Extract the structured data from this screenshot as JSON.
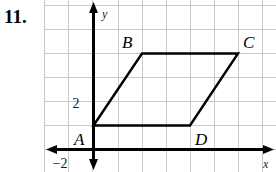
{
  "problem": {
    "number": "11."
  },
  "graph": {
    "axis_labels": {
      "x": "x",
      "y": "y"
    },
    "tick_labels": [
      {
        "text": "2",
        "axis": "y",
        "value": 2
      },
      {
        "text": "−2",
        "axis": "x",
        "value": -2
      }
    ],
    "grid": {
      "visible": true,
      "color": "#c8c8c8",
      "spacing_px": 24,
      "x_range": [
        -2,
        7
      ],
      "y_range": [
        -1,
        6
      ]
    },
    "axis_color": "#000000",
    "shape_color": "#000000",
    "shape": {
      "name": "parallelogram-abcd",
      "vertices": [
        {
          "label": "A",
          "x": 0,
          "y": 1
        },
        {
          "label": "B",
          "x": 2,
          "y": 4
        },
        {
          "label": "C",
          "x": 6,
          "y": 4
        },
        {
          "label": "D",
          "x": 4,
          "y": 1
        }
      ]
    }
  }
}
